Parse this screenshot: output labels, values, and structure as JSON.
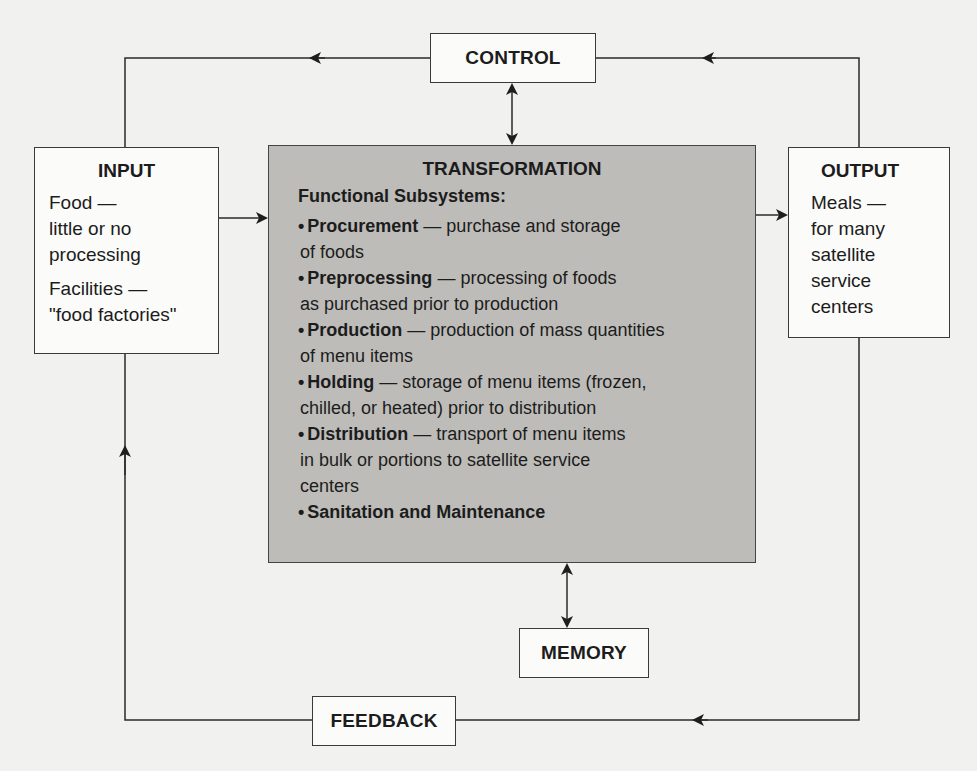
{
  "diagram": {
    "control": {
      "label": "CONTROL"
    },
    "input": {
      "title": "INPUT",
      "items": [
        {
          "lines": [
            "Food —",
            "little or no",
            "processing"
          ]
        },
        {
          "lines": [
            "Facilities —",
            "\"food factories\""
          ]
        }
      ]
    },
    "transformation": {
      "title": "TRANSFORMATION",
      "subtitle": "Functional Subsystems:",
      "bullet": "•",
      "subsystems": [
        {
          "name": "Procurement",
          "desc_first": " — purchase and storage",
          "desc_rest": [
            "of foods"
          ]
        },
        {
          "name": "Preprocessing",
          "desc_first": " —  processing of foods",
          "desc_rest": [
            "as purchased prior to production"
          ]
        },
        {
          "name": "Production",
          "desc_first": " — production of mass quantities",
          "desc_rest": [
            "of menu items"
          ]
        },
        {
          "name": "Holding",
          "desc_first": " — storage of menu items (frozen,",
          "desc_rest": [
            "chilled, or heated) prior to distribution"
          ]
        },
        {
          "name": "Distribution",
          "desc_first": " — transport of menu items",
          "desc_rest": [
            "in bulk or portions to satellite service",
            "centers"
          ]
        },
        {
          "name": "Sanitation and Maintenance",
          "desc_first": "",
          "desc_rest": []
        }
      ]
    },
    "output": {
      "title": "OUTPUT",
      "lines": [
        "Meals —",
        "for many",
        "satellite",
        "service",
        "centers"
      ]
    },
    "memory": {
      "label": "MEMORY"
    },
    "feedback": {
      "label": "FEEDBACK"
    },
    "colors": {
      "background": "#f1f1ef",
      "transformation_fill": "#bdbcb9",
      "line": "#2a2a2a"
    }
  }
}
